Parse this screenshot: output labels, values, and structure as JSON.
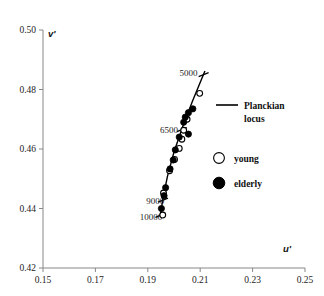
{
  "chart_data": {
    "type": "scatter",
    "title": "",
    "xlabel": "u'",
    "ylabel": "v'",
    "xlim": [
      0.15,
      0.25
    ],
    "ylim": [
      0.42,
      0.5
    ],
    "xticks": [
      "0.15",
      "0.17",
      "0.19",
      "0.21",
      "0.23",
      "0.25"
    ],
    "xtick_values": [
      0.15,
      0.17,
      0.19,
      0.21,
      0.23,
      0.25
    ],
    "yticks": [
      "0.42",
      "0.44",
      "0.46",
      "0.48",
      "0.50"
    ],
    "ytick_values": [
      0.42,
      0.44,
      0.46,
      0.48,
      0.5
    ],
    "grid": false,
    "legend_position": "right",
    "legend": [
      {
        "key": "planckian-locus",
        "label_line1": "Planckian",
        "label_line2": "locus",
        "marker": "line",
        "color": "#000000"
      },
      {
        "key": "young",
        "label": "young",
        "marker": "open-circle",
        "color": "#000000"
      },
      {
        "key": "elderly",
        "label": "elderly",
        "marker": "filled-circle",
        "color": "#000000"
      }
    ],
    "annotations": [
      {
        "text": "5000",
        "x": 0.209,
        "y": 0.4855,
        "anchor": "end"
      },
      {
        "text": "6500",
        "x": 0.2015,
        "y": 0.4665,
        "anchor": "end"
      },
      {
        "text": "9000",
        "x": 0.1963,
        "y": 0.4425,
        "anchor": "end"
      },
      {
        "text": "10000",
        "x": 0.1955,
        "y": 0.4373,
        "anchor": "end"
      }
    ],
    "locus": {
      "name": "Planckian locus",
      "points": [
        {
          "u": 0.2118,
          "v": 0.4862
        },
        {
          "u": 0.207,
          "v": 0.476
        },
        {
          "u": 0.2032,
          "v": 0.4672
        },
        {
          "u": 0.2,
          "v": 0.459
        },
        {
          "u": 0.1975,
          "v": 0.4508
        },
        {
          "u": 0.1958,
          "v": 0.4435
        },
        {
          "u": 0.1948,
          "v": 0.4378
        }
      ],
      "cct_ticks": [
        {
          "cct": 5000,
          "u": 0.2113,
          "v": 0.485
        },
        {
          "cct": 6500,
          "u": 0.203,
          "v": 0.4665
        },
        {
          "cct": 9000,
          "u": 0.1958,
          "v": 0.4428
        },
        {
          "cct": 10000,
          "u": 0.1948,
          "v": 0.4377
        }
      ]
    },
    "series": [
      {
        "name": "young",
        "marker": "open-circle",
        "points": [
          {
            "u": 0.2098,
            "v": 0.4787
          },
          {
            "u": 0.205,
            "v": 0.47
          },
          {
            "u": 0.2037,
            "v": 0.4663
          },
          {
            "u": 0.203,
            "v": 0.4633
          },
          {
            "u": 0.202,
            "v": 0.4602
          },
          {
            "u": 0.2002,
            "v": 0.4565
          },
          {
            "u": 0.1983,
            "v": 0.4527
          },
          {
            "u": 0.196,
            "v": 0.4452
          },
          {
            "u": 0.1957,
            "v": 0.4378
          }
        ]
      },
      {
        "name": "elderly",
        "marker": "filled-circle",
        "points": [
          {
            "u": 0.2072,
            "v": 0.4735
          },
          {
            "u": 0.2055,
            "v": 0.4722
          },
          {
            "u": 0.2043,
            "v": 0.4707
          },
          {
            "u": 0.2037,
            "v": 0.469
          },
          {
            "u": 0.2055,
            "v": 0.465
          },
          {
            "u": 0.202,
            "v": 0.464
          },
          {
            "u": 0.2005,
            "v": 0.4597
          },
          {
            "u": 0.1997,
            "v": 0.4563
          },
          {
            "u": 0.1985,
            "v": 0.4533
          },
          {
            "u": 0.1968,
            "v": 0.447
          },
          {
            "u": 0.1962,
            "v": 0.4443
          },
          {
            "u": 0.1952,
            "v": 0.44
          }
        ]
      }
    ]
  }
}
